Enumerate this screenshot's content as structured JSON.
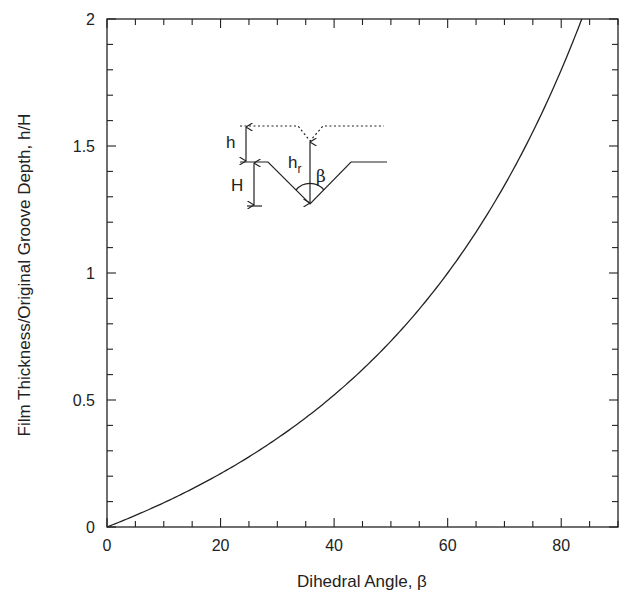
{
  "chart_data": {
    "type": "line",
    "title": "",
    "xlabel": "Dihedral Angle, β",
    "ylabel": "Film Thickness/Original Groove Depth, h/H",
    "xlim": [
      0,
      90
    ],
    "ylim": [
      0,
      2
    ],
    "x_ticks": [
      0,
      20,
      40,
      60,
      80
    ],
    "x_tick_labels": [
      "0",
      "20",
      "40",
      "60",
      "80"
    ],
    "x_minor_step": 5,
    "y_ticks": [
      0,
      0.5,
      1,
      1.5,
      2
    ],
    "y_tick_labels": [
      "0",
      "0.5",
      "1",
      "1.5",
      "2"
    ],
    "y_minor_step": 0.1,
    "grid": false,
    "legend": null,
    "series": [
      {
        "name": "h/H vs β",
        "x": [
          0,
          5,
          10,
          15,
          20,
          25,
          30,
          35,
          40,
          45,
          50,
          55,
          60,
          65,
          70,
          75,
          80,
          84
        ],
        "y": [
          0,
          0.046,
          0.095,
          0.15,
          0.21,
          0.28,
          0.35,
          0.43,
          0.52,
          0.62,
          0.73,
          0.86,
          1.0,
          1.16,
          1.35,
          1.56,
          1.8,
          2.0
        ]
      }
    ],
    "annotations": {
      "inset_diagram": {
        "description": "V-groove of depth H with film of thickness h above flat surface; dotted film surface dips over groove; arrow h_r from groove bottom to film surface; dihedral angle β marked at groove bottom",
        "labels": [
          "h",
          "H",
          "h_r",
          "β"
        ]
      }
    }
  },
  "inset": {
    "h_label": "h",
    "H_label": "H",
    "hr_label": "h",
    "hr_sub": "r",
    "beta_label": "β"
  },
  "axes": {
    "xlabel": "Dihedral Angle, β",
    "ylabel": "Film Thickness/Original Groove Depth, h/H"
  }
}
